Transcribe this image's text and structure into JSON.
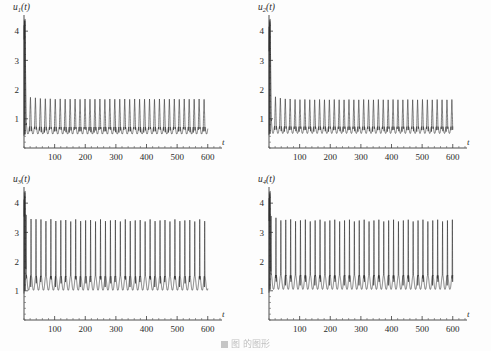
{
  "figure": {
    "background_color": "#fdfdfd",
    "curve_color": "#2e2e2e",
    "axis_color": "#3a3a3a",
    "caption": "图   的图形",
    "caption_visible": "partially cropped at bottom edge"
  },
  "chart_data": [
    {
      "type": "line",
      "panel": 1,
      "title": "",
      "ylabel": "u₁(t)",
      "ylabel_base": "u",
      "ylabel_sub": "1",
      "ylabel_arg": "(t)",
      "xlabel": "t",
      "xlim": [
        0,
        640
      ],
      "ylim": [
        0,
        4.45
      ],
      "xticks": [
        100,
        200,
        300,
        400,
        500,
        600
      ],
      "xtick_labels": [
        "100",
        "200",
        "300",
        "400",
        "500",
        "600"
      ],
      "yticks": [
        1,
        2,
        3,
        4
      ],
      "ytick_labels": [
        "1",
        "2",
        "3",
        "4"
      ],
      "grid": false,
      "legend": "none",
      "series": [
        {
          "name": "u1",
          "waveform": "relaxation-oscillation",
          "transient_spike": {
            "t": 2.0,
            "peak": 4.35,
            "decay": 3.0
          },
          "steady_min": 0.48,
          "steady_max": 1.68,
          "first_peak": 1.82,
          "period": 16.2,
          "t_start": 0,
          "t_end": 600,
          "peak_sharpness": 0.34,
          "peak_phase": 0.3,
          "settle_time": 30
        }
      ]
    },
    {
      "type": "line",
      "panel": 2,
      "title": "",
      "ylabel": "u₂(t)",
      "ylabel_base": "u",
      "ylabel_sub": "2",
      "ylabel_arg": "(t)",
      "xlabel": "t",
      "xlim": [
        0,
        640
      ],
      "ylim": [
        0,
        4.45
      ],
      "xticks": [
        100,
        200,
        300,
        400,
        500,
        600
      ],
      "xtick_labels": [
        "100",
        "200",
        "300",
        "400",
        "500",
        "600"
      ],
      "yticks": [
        1,
        2,
        3,
        4
      ],
      "ytick_labels": [
        "1",
        "2",
        "3",
        "4"
      ],
      "grid": false,
      "legend": "none",
      "series": [
        {
          "name": "u2",
          "waveform": "relaxation-oscillation",
          "transient_spike": {
            "t": 2.5,
            "peak": 4.3,
            "decay": 3.2
          },
          "steady_min": 0.5,
          "steady_max": 1.66,
          "first_peak": 1.85,
          "period": 16.0,
          "t_start": 0,
          "t_end": 600,
          "peak_sharpness": 0.34,
          "peak_phase": 0.32,
          "settle_time": 30
        }
      ]
    },
    {
      "type": "line",
      "panel": 3,
      "title": "",
      "ylabel": "u₃(t)",
      "ylabel_base": "u",
      "ylabel_sub": "3",
      "ylabel_arg": "(t)",
      "xlabel": "t",
      "xlim": [
        0,
        640
      ],
      "ylim": [
        0,
        4.45
      ],
      "xticks": [
        100,
        200,
        300,
        400,
        500,
        600
      ],
      "xtick_labels": [
        "100",
        "200",
        "300",
        "400",
        "500",
        "600"
      ],
      "yticks": [
        1,
        2,
        3,
        4
      ],
      "ytick_labels": [
        "1",
        "2",
        "3",
        "4"
      ],
      "grid": false,
      "legend": "none",
      "series": [
        {
          "name": "u3",
          "waveform": "spiking-oscillation",
          "transient_spike": {
            "t": 2.0,
            "peak": 4.25,
            "decay": 2.6
          },
          "steady_min": 1.02,
          "steady_max": 3.45,
          "first_peak": 3.62,
          "period": 16.2,
          "t_start": 0,
          "t_end": 600,
          "peak_sharpness": 0.12,
          "peak_phase": 0.42,
          "settle_time": 28
        }
      ]
    },
    {
      "type": "line",
      "panel": 4,
      "title": "",
      "ylabel": "u₄(t)",
      "ylabel_base": "u",
      "ylabel_sub": "4",
      "ylabel_arg": "(t)",
      "xlabel": "t",
      "xlim": [
        0,
        640
      ],
      "ylim": [
        0,
        4.45
      ],
      "xticks": [
        100,
        200,
        300,
        400,
        500,
        600
      ],
      "xtick_labels": [
        "100",
        "200",
        "300",
        "400",
        "500",
        "600"
      ],
      "yticks": [
        1,
        2,
        3,
        4
      ],
      "ytick_labels": [
        "1",
        "2",
        "3",
        "4"
      ],
      "grid": false,
      "legend": "none",
      "series": [
        {
          "name": "u4",
          "waveform": "spiking-oscillation",
          "transient_spike": {
            "t": 2.2,
            "peak": 4.3,
            "decay": 2.6
          },
          "steady_min": 1.05,
          "steady_max": 3.45,
          "first_peak": 3.6,
          "period": 16.0,
          "t_start": 0,
          "t_end": 600,
          "peak_sharpness": 0.12,
          "peak_phase": 0.42,
          "settle_time": 28
        }
      ]
    }
  ]
}
